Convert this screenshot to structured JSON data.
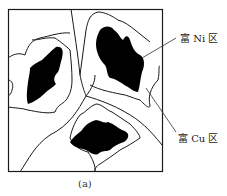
{
  "figure": {
    "caption": "(a)",
    "labels": {
      "ni_rich": "富 Ni 区",
      "cu_rich": "富 Cu 区"
    },
    "colors": {
      "stroke": "#1a1a1a",
      "fill_ni": "#000000",
      "background": "#ffffff"
    }
  }
}
